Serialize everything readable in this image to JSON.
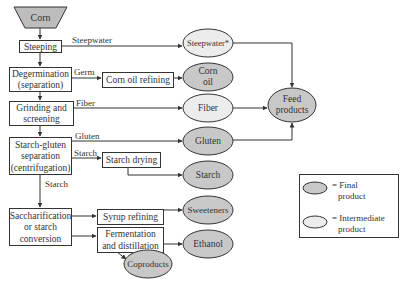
{
  "colors": {
    "line": "#333333",
    "final_fill": "#c8c8c8",
    "intermediate_fill": "#ececec",
    "trapezoid_fill": "#bdbdbd",
    "box_fill": "#ffffff",
    "text": "#333333"
  },
  "input": {
    "label": "Corn"
  },
  "process_steps": [
    {
      "id": "steeping",
      "lines": [
        "Steeping"
      ]
    },
    {
      "id": "degermination",
      "lines": [
        "Degermination",
        "(separation)"
      ]
    },
    {
      "id": "grinding",
      "lines": [
        "Grinding and",
        "screening"
      ]
    },
    {
      "id": "starch-gluten",
      "lines": [
        "Starch-gluten",
        "separation",
        "(centrifugation)"
      ]
    },
    {
      "id": "saccharification",
      "lines": [
        "Saccharification",
        "or starch",
        "conversion"
      ]
    }
  ],
  "secondary_steps": [
    {
      "id": "corn-oil-refining",
      "lines": [
        "Corn oil refining"
      ]
    },
    {
      "id": "starch-drying",
      "lines": [
        "Starch drying"
      ]
    },
    {
      "id": "syrup-refining",
      "lines": [
        "Syrup refining"
      ]
    },
    {
      "id": "fermentation",
      "lines": [
        "Fermentation",
        "and distillation"
      ]
    }
  ],
  "stream_labels": {
    "steepwater": "Steepwater",
    "germ": "Germ",
    "fiber": "Fiber",
    "gluten": "Gluten",
    "starch_to_drying": "Starch",
    "starch_down": "Starch"
  },
  "products": [
    {
      "id": "steepwater",
      "lines": [
        "Steepwater*"
      ],
      "type": "intermediate"
    },
    {
      "id": "corn-oil",
      "lines": [
        "Corn",
        "oil"
      ],
      "type": "final"
    },
    {
      "id": "fiber",
      "lines": [
        "Fiber"
      ],
      "type": "intermediate"
    },
    {
      "id": "gluten",
      "lines": [
        "Gluten"
      ],
      "type": "final"
    },
    {
      "id": "starch",
      "lines": [
        "Starch"
      ],
      "type": "final"
    },
    {
      "id": "sweeteners",
      "lines": [
        "Sweeteners"
      ],
      "type": "final"
    },
    {
      "id": "ethanol",
      "lines": [
        "Ethanol"
      ],
      "type": "final"
    },
    {
      "id": "coproducts",
      "lines": [
        "Coproducts"
      ],
      "type": "final"
    },
    {
      "id": "feed-products",
      "lines": [
        "Feed",
        "products"
      ],
      "type": "final"
    }
  ],
  "legend": {
    "final": {
      "lines": [
        "= Final",
        "product"
      ]
    },
    "intermediate": {
      "lines": [
        "= Intermediate",
        "product"
      ]
    }
  }
}
